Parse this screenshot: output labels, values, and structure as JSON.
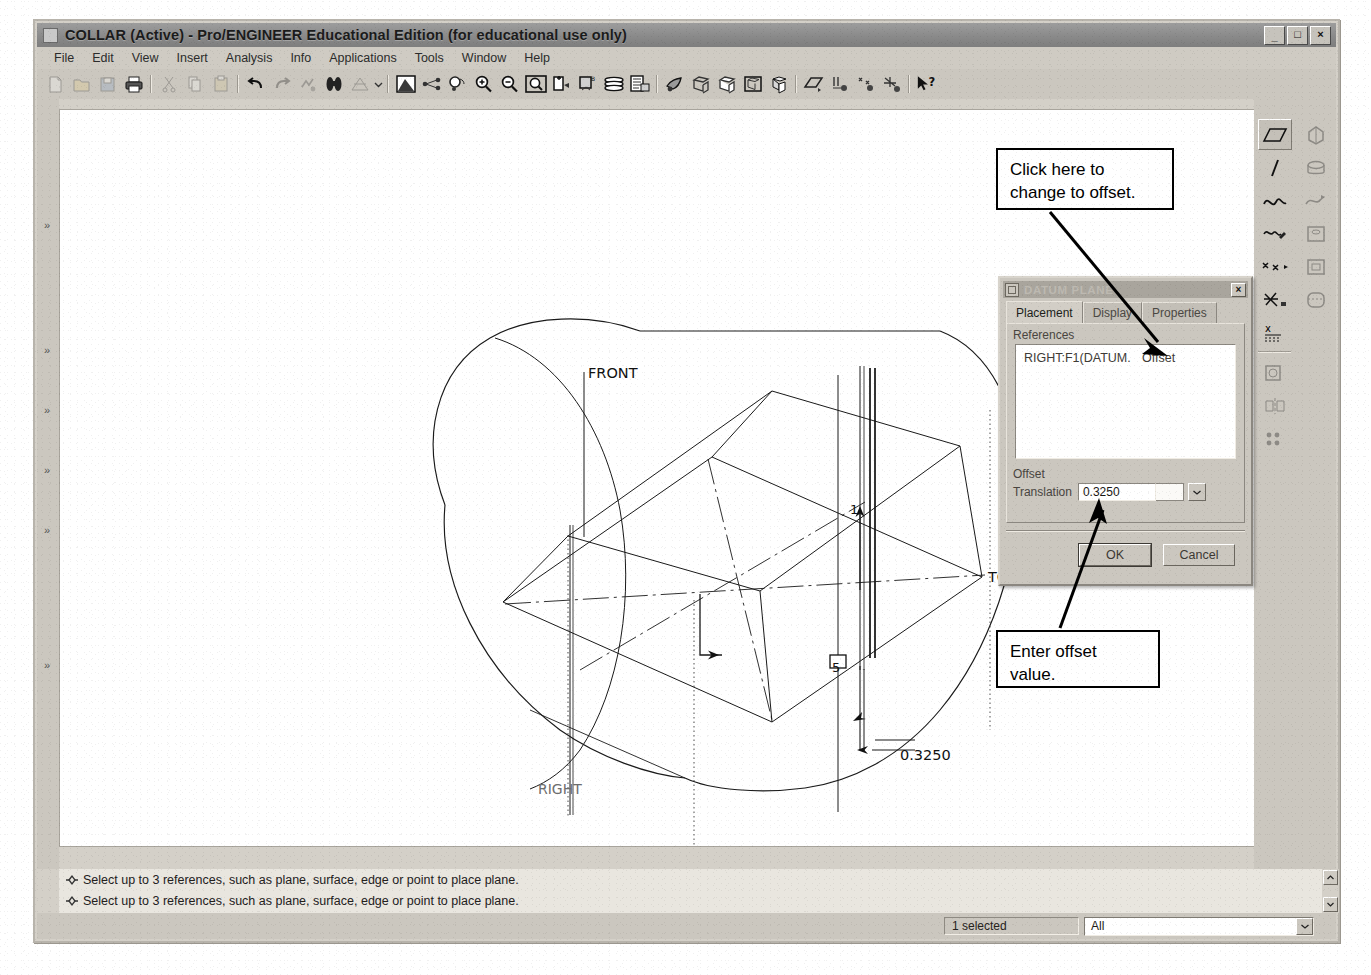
{
  "window": {
    "title": "COLLAR (Active) - Pro/ENGINEER Educational Edition (for educational use only)",
    "minimize_label": "_",
    "maximize_label": "□",
    "close_label": "×"
  },
  "menu": {
    "items": [
      {
        "label": "File"
      },
      {
        "label": "Edit"
      },
      {
        "label": "View"
      },
      {
        "label": "Insert"
      },
      {
        "label": "Analysis"
      },
      {
        "label": "Info"
      },
      {
        "label": "Applications"
      },
      {
        "label": "Tools"
      },
      {
        "label": "Window"
      },
      {
        "label": "Help"
      }
    ]
  },
  "toolbar": {
    "icons": [
      "new-file-icon",
      "open-file-icon",
      "save-file-icon",
      "print-icon",
      "sep",
      "cut-icon",
      "copy-icon",
      "paste-icon",
      "sep",
      "undo-icon",
      "redo-icon",
      "regenerate-icon",
      "find-icon",
      "repaint-icon",
      "toolbar-dropdown-icon",
      "sep",
      "shaded-view-icon",
      "datum-display-icon",
      "spin-center-icon",
      "zoom-in-icon",
      "zoom-out-icon",
      "refit-icon",
      "saved-views-icon",
      "view-manager-icon",
      "layers-icon",
      "model-tree-icon",
      "sep",
      "appearance-icon",
      "wireframe-icon",
      "hiddenline-icon",
      "nohidden-icon",
      "shading-icon",
      "sep",
      "datum-plane-display-icon",
      "datum-axis-display-icon",
      "datum-point-display-icon",
      "datum-csys-display-icon",
      "sep",
      "context-help-icon"
    ]
  },
  "left_dock": {
    "markers": [
      "chevron-marker",
      "chevron-marker",
      "chevron-marker",
      "chevron-marker",
      "chevron-marker",
      "chevron-marker"
    ]
  },
  "right_dock": {
    "column_a": [
      "datum-plane-tool-icon",
      "datum-axis-tool-icon",
      "curve-tool-icon",
      "sketch-tool-icon",
      "datum-point-tool-icon",
      "coord-sys-tool-icon",
      "analysis-feature-icon"
    ],
    "column_b": [
      "extrude-tool-icon",
      "revolve-tool-icon",
      "sweep-tool-icon",
      "hole-tool-icon",
      "shell-tool-icon",
      "round-tool-icon"
    ]
  },
  "graphics": {
    "model_name": "COLLAR",
    "datum_labels": [
      {
        "name": "FRONT",
        "x": 528,
        "y": 266
      },
      {
        "name": "TOP",
        "x": 928,
        "y": 467
      },
      {
        "name": "RIGHT",
        "x": 504,
        "y": 682
      }
    ],
    "dimension": {
      "value": "0.3250",
      "x": 866,
      "y": 645
    },
    "reference_tags": [
      {
        "label": "1",
        "x": 818,
        "y": 400
      },
      {
        "label": "5",
        "x": 797,
        "y": 557
      }
    ]
  },
  "dialog": {
    "title": "DATUM PLANE",
    "close_label": "×",
    "tabs": [
      {
        "label": "Placement",
        "selected": true
      },
      {
        "label": "Display",
        "selected": false
      },
      {
        "label": "Properties",
        "selected": false
      }
    ],
    "references_group_label": "References",
    "references": [
      {
        "name": "RIGHT:F1(DATUM.",
        "constraint": "Offset"
      }
    ],
    "offset_group_label": "Offset",
    "translation_label": "Translation",
    "translation_value": "0.3250",
    "dropdown_icon": "chevron-down-icon",
    "buttons": [
      {
        "label": "OK",
        "default": true
      },
      {
        "label": "Cancel",
        "default": false
      }
    ]
  },
  "callouts": [
    {
      "text": "Click here to change to offset."
    },
    {
      "text": "Enter offset value."
    }
  ],
  "messages": {
    "rows": [
      {
        "icon": "message-arrow-icon",
        "text": "Select up to 3 references, such as plane, surface, edge or point to place plane."
      },
      {
        "icon": "message-arrow-icon",
        "text": "Select up to 3 references, such as plane, surface, edge or point to place plane."
      }
    ],
    "scroll_up_icon": "scroll-up-icon",
    "scroll_down_icon": "scroll-down-icon"
  },
  "status_bar": {
    "selection_count": "1 selected",
    "filter_value": "All",
    "filter_arrow_icon": "chevron-down-icon"
  },
  "colors": {
    "window_face": "#cbc7bf",
    "titlebar": "#8a8a8a",
    "graphics_bg": "#ffffff",
    "geometry": "#1a1a1a"
  }
}
